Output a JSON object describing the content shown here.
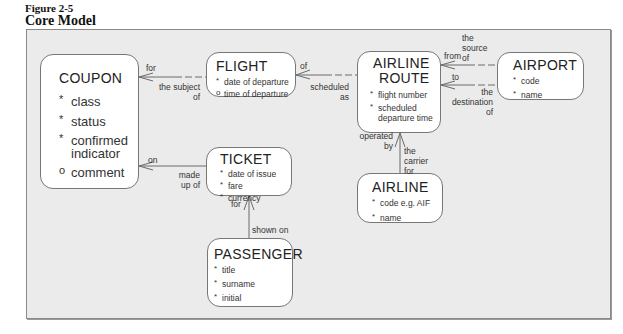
{
  "figure": {
    "number": "Figure 2-5",
    "title": "Core Model"
  },
  "entities": {
    "coupon": {
      "name": "COUPON",
      "attributes": [
        {
          "mark": "*",
          "text": "class"
        },
        {
          "mark": "*",
          "text": "status"
        },
        {
          "mark": "*",
          "text": "confirmed indicator"
        },
        {
          "mark": "o",
          "text": "comment"
        }
      ]
    },
    "flight": {
      "name": "FLIGHT",
      "attributes": [
        {
          "mark": "*",
          "text": "date of departure"
        },
        {
          "mark": "o",
          "text": "time of departure"
        }
      ]
    },
    "airline_route": {
      "name_line1": "AIRLINE",
      "name_line2": "ROUTE",
      "attributes": [
        {
          "mark": "*",
          "text": "flight number"
        },
        {
          "mark": "*",
          "text": "scheduled departure time"
        }
      ]
    },
    "airport": {
      "name": "AIRPORT",
      "attributes": [
        {
          "mark": "*",
          "text": "code"
        },
        {
          "mark": "*",
          "text": "name"
        }
      ]
    },
    "ticket": {
      "name": "TICKET",
      "attributes": [
        {
          "mark": "*",
          "text": "date of issue"
        },
        {
          "mark": "*",
          "text": "fare"
        },
        {
          "mark": "*",
          "text": "currency"
        }
      ]
    },
    "airline": {
      "name": "AIRLINE",
      "attributes": [
        {
          "mark": "*",
          "text": "code e.g. AIF"
        },
        {
          "mark": "*",
          "text": "name"
        }
      ]
    },
    "passenger": {
      "name": "PASSENGER",
      "attributes": [
        {
          "mark": "*",
          "text": "title"
        },
        {
          "mark": "*",
          "text": "surname"
        },
        {
          "mark": "*",
          "text": "initial"
        }
      ]
    }
  },
  "relationships": {
    "coupon_flight": {
      "from_label": "for",
      "to_label_1": "the subject",
      "to_label_2": "of"
    },
    "flight_route": {
      "from_label": "of",
      "to_label_1": "scheduled",
      "to_label_2": "as"
    },
    "route_airport_source": {
      "from_label": "from",
      "to_label_1": "the",
      "to_label_2": "source",
      "to_label_3": "of"
    },
    "route_airport_dest": {
      "from_label": "to",
      "to_label_1": "the",
      "to_label_2": "destination",
      "to_label_3": "of"
    },
    "route_airline": {
      "from_label_1": "operated",
      "from_label_2": "by",
      "to_label_1": "the",
      "to_label_2": "carrier",
      "to_label_3": "for"
    },
    "coupon_ticket": {
      "from_label": "on",
      "to_label_1": "made",
      "to_label_2": "up of"
    },
    "ticket_passenger": {
      "from_label": "for",
      "to_label": "shown on"
    }
  }
}
